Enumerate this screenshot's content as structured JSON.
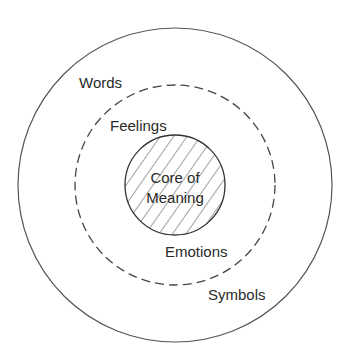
{
  "diagram": {
    "type": "concentric-circles",
    "center": [
      175,
      185
    ],
    "rings": [
      {
        "name": "outer",
        "radius": 157,
        "style": "solid",
        "labels": [
          "Words",
          "Symbols"
        ]
      },
      {
        "name": "middle",
        "radius": 100,
        "style": "dashed",
        "labels": [
          "Feelings",
          "Emotions"
        ]
      },
      {
        "name": "core",
        "radius": 50,
        "style": "solid-hatched",
        "labels": [
          "Core of",
          "Meaning"
        ]
      }
    ],
    "labels": {
      "words": "Words",
      "symbols": "Symbols",
      "feelings": "Feelings",
      "emotions": "Emotions",
      "core_line1": "Core of",
      "core_line2": "Meaning"
    },
    "colors": {
      "stroke": "#555555",
      "text": "#2a2a2a",
      "background": "#ffffff"
    }
  }
}
